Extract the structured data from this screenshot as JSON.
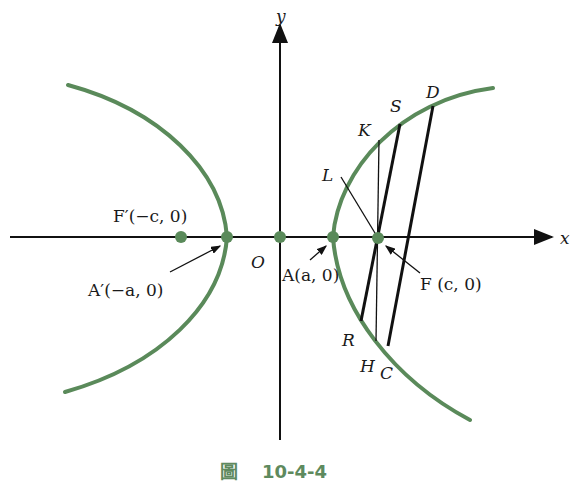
{
  "figure": {
    "caption_prefix": "圖",
    "caption_number": "10-4-4",
    "colors": {
      "curve": "#5a8a5a",
      "point": "#5a8a5a",
      "line": "#111111",
      "caption": "#5e8a5e"
    },
    "axes": {
      "x_label": "x",
      "y_label": "y",
      "origin_label": "O"
    },
    "points": {
      "F_prime": "F′(−c, 0)",
      "A_prime": "A′(−a, 0)",
      "A": "A(a, 0)",
      "F": "F (c, 0)"
    },
    "chord_endpoints": [
      "K",
      "S",
      "D",
      "L",
      "R",
      "H",
      "C"
    ]
  }
}
